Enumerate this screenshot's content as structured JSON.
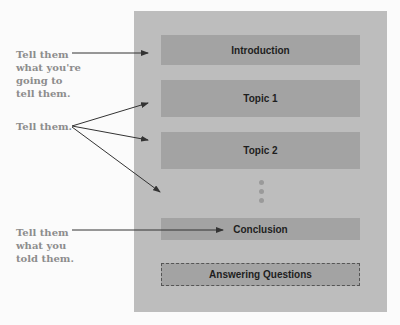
{
  "diagram": {
    "sections": [
      {
        "label": "Introduction"
      },
      {
        "label": "Topic 1"
      },
      {
        "label": "Topic 2"
      },
      {
        "label": "Conclusion"
      },
      {
        "label": "Answering Questions",
        "style": "dashed"
      }
    ],
    "annotations": [
      {
        "lines": [
          "Tell them",
          "what you're",
          "going to",
          "tell them."
        ],
        "points_to": [
          "Introduction"
        ]
      },
      {
        "lines": [
          "Tell them."
        ],
        "points_to": [
          "Topic 1",
          "Topic 2",
          "ellipsis"
        ]
      },
      {
        "lines": [
          "Tell them",
          "what you",
          "told them."
        ],
        "points_to": [
          "Conclusion"
        ]
      }
    ],
    "colors": {
      "panel": "#bdbdbd",
      "box": "#a3a3a3",
      "label": "#8d8d8d",
      "arrow": "#333333"
    }
  }
}
